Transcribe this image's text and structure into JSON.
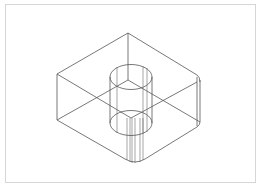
{
  "figure": {
    "title": "",
    "colors": {
      "line": "#555555",
      "frame": "#d6d6d6",
      "background": "#ffffff"
    },
    "block": {
      "top_face": {
        "back": [
          128,
          33
        ],
        "left": [
          57,
          74
        ],
        "right": [
          198,
          77
        ],
        "front": [
          131,
          118
        ]
      },
      "bottom_face": {
        "back": [
          128,
          80
        ],
        "left": [
          57,
          120
        ],
        "right": [
          198,
          124
        ],
        "front": [
          135,
          163
        ]
      }
    },
    "cylinder": {
      "center_x": 131,
      "rx": 21,
      "ry": 12.5,
      "top_y": 77,
      "bottom_y": 123
    }
  }
}
